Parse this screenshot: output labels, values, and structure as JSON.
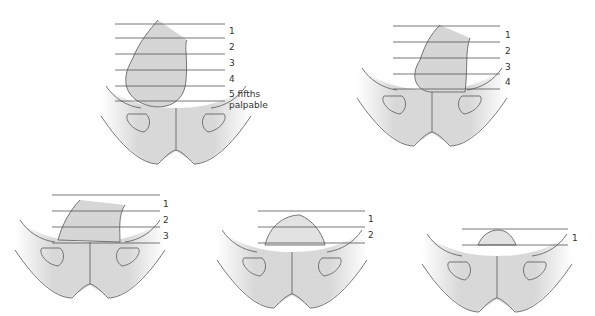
{
  "diagram": {
    "colors": {
      "pelvis": "#d9d9d9",
      "head": "#d6d6d6",
      "line": "#555555",
      "background": "#ffffff"
    },
    "panels": [
      {
        "id": "p5",
        "labels": [
          "1",
          "2",
          "3",
          "4",
          "5 fifths",
          "palpable"
        ]
      },
      {
        "id": "p4",
        "labels": [
          "1",
          "2",
          "3",
          "4"
        ]
      },
      {
        "id": "p3",
        "labels": [
          "1",
          "2",
          "3"
        ]
      },
      {
        "id": "p2",
        "labels": [
          "1",
          "2"
        ]
      },
      {
        "id": "p1",
        "labels": [
          "1"
        ]
      }
    ]
  }
}
